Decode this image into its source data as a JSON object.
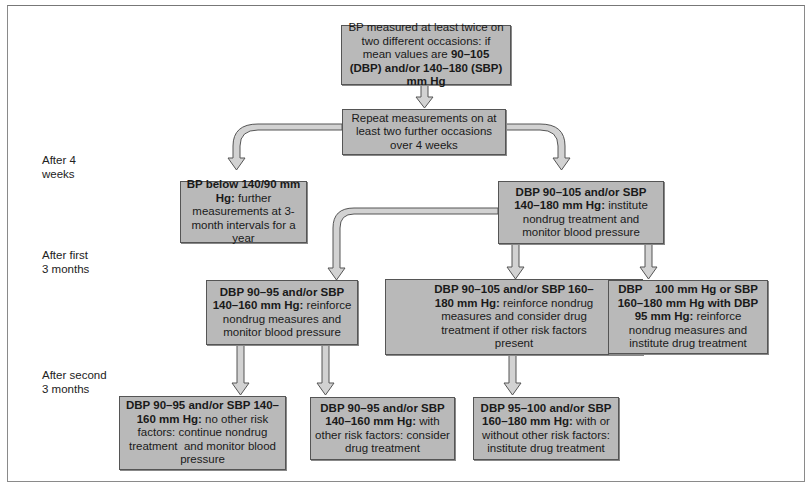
{
  "stages": [
    {
      "id": "after-4-weeks",
      "line1": "After 4",
      "line2": "weeks"
    },
    {
      "id": "after-first-3-months",
      "line1": "After first",
      "line2": "3 months"
    },
    {
      "id": "after-second-3-months",
      "line1": "After second",
      "line2": "3 months"
    }
  ],
  "boxes": {
    "start": {
      "pre": "BP measured at least twice on two different occasions: if mean values are ",
      "bold": "90–105 (DBP) and/or 140–180 (SBP) mm Hg",
      "post": ""
    },
    "repeat": {
      "pre": "Repeat measurements on at least two further occasions over 4 weeks",
      "bold": "",
      "post": ""
    },
    "below": {
      "bold": "BP below 140/90 mm Hg:",
      "post": " further measurements at 3-month intervals for a year"
    },
    "nondrug": {
      "bold": "DBP 90–105 and/or SBP 140–180 mm Hg:",
      "post": " institute nondrug treatment and monitor blood pressure"
    },
    "mild": {
      "bold": "DBP 90–95 and/or SBP 140–160 mm Hg:",
      "post": " reinforce nondrug measures and monitor blood pressure"
    },
    "moderate": {
      "bold": "DBP 90–105 and/or SBP 160–180 mm Hg:",
      "post": " reinforce nondrug measures and consider drug treatment if other risk factors present"
    },
    "severe": {
      "bold": "DBP    100 mm Hg or SBP 160–180 mm Hg with DBP 95 mm Hg:",
      "post": " reinforce nondrug measures and institute drug treatment"
    },
    "mild_norisk": {
      "bold": "DBP 90–95 and/or SBP 140–160 mm Hg:",
      "post": " no other risk factors: continue nondrug treatment  and monitor blood pressure"
    },
    "mild_risk": {
      "bold": "DBP 90–95 and/or SBP 140–160 mm Hg:",
      "post": " with other risk factors: consider drug treatment"
    },
    "moderate_any": {
      "bold": "DBP 95–100 and/or SBP 160–180 mm Hg:",
      "post": " with or without other risk factors: institute drug treatment"
    }
  },
  "colors": {
    "box_fill": "#b9b9b9",
    "box_border": "#555555",
    "arrow_fill": "#d2d2d2",
    "arrow_stroke": "#555555"
  }
}
